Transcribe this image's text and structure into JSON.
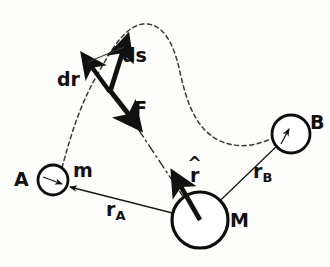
{
  "figure": {
    "type": "physics-vector-diagram",
    "width": 330,
    "height": 267,
    "background_color": "#fdfdfc",
    "ink_color": "#111111"
  },
  "bodies": [
    {
      "id": "A",
      "label": "A",
      "secondary_label": "m",
      "role": "start-point-mass",
      "cx": 53,
      "cy": 180,
      "r": 15,
      "stroke_width": 2.6
    },
    {
      "id": "M",
      "label": "M",
      "role": "central-mass",
      "cx": 200,
      "cy": 220,
      "r": 28,
      "stroke_width": 3.0
    },
    {
      "id": "B",
      "label": "B",
      "role": "end-point",
      "cx": 291,
      "cy": 134,
      "r": 19,
      "stroke_width": 2.6
    }
  ],
  "vectors": [
    {
      "id": "ds",
      "label": "ds",
      "style": "bold-solid",
      "from": [
        110,
        92
      ],
      "to": [
        125,
        45
      ],
      "description": "displacement element along the path, tangent to trajectory"
    },
    {
      "id": "dr",
      "label": "dr",
      "style": "bold-solid",
      "from": [
        110,
        92
      ],
      "to": [
        88,
        63
      ],
      "description": "radial displacement component"
    },
    {
      "id": "F",
      "label": "F",
      "style": "bold-solid",
      "from": [
        110,
        92
      ],
      "to": [
        133,
        120
      ],
      "description": "gravitational force on m directed toward M"
    },
    {
      "id": "r-hat",
      "label": "r",
      "accent": "^",
      "style": "bold-solid",
      "from": [
        200,
        220
      ],
      "to": [
        176,
        178
      ],
      "description": "radial unit vector from M outward"
    }
  ],
  "radii": [
    {
      "id": "rA",
      "label": "r",
      "subscript": "A",
      "from": [
        200,
        220
      ],
      "to": [
        67,
        187
      ],
      "style": "thin-solid-arrow",
      "description": "distance from M to starting position A"
    },
    {
      "id": "rB",
      "label": "r",
      "subscript": "B",
      "from": [
        200,
        220
      ],
      "to": [
        278,
        142
      ],
      "style": "thin-solid-arrow",
      "description": "distance from M to end position B"
    }
  ],
  "path": {
    "id": "trajectory",
    "style": "dashed",
    "description": "dashed S-shaped trajectory of mass m from A over a peak down to B",
    "points": "M 62,168 C 72,130 82,100 100,70 C 112,48 126,26 143,24 C 163,22 174,44 180,72 C 187,104 196,128 218,140 C 238,150 258,145 273,138"
  },
  "force_line": {
    "id": "force-action-line",
    "style": "dash-dot",
    "description": "dash-dot line of action of F extending from the force vector tip to the centre of M",
    "from": [
      133,
      120
    ],
    "to": [
      200,
      220
    ]
  },
  "labels": {
    "A": {
      "text": "A",
      "x": 14,
      "y": 171,
      "weight": "plain"
    },
    "m": {
      "text": "m",
      "x": 73,
      "y": 163,
      "weight": "plain"
    },
    "M": {
      "text": "M",
      "x": 230,
      "y": 212,
      "weight": "plain"
    },
    "B": {
      "text": "B",
      "x": 311,
      "y": 114,
      "weight": "plain"
    },
    "ds": {
      "text": "ds",
      "x": 122,
      "y": 46,
      "weight": "bold"
    },
    "dr": {
      "text": "dr",
      "x": 58,
      "y": 70,
      "weight": "bold"
    },
    "F": {
      "text": "F",
      "x": 133,
      "y": 99,
      "weight": "bold"
    },
    "r_hat": {
      "text": "r",
      "accent": "^",
      "x": 190,
      "y": 164
    },
    "r_A": {
      "text": "r",
      "subscript": "A",
      "x": 106,
      "y": 201
    },
    "r_B": {
      "text": "r",
      "subscript": "B",
      "x": 253,
      "y": 163
    }
  }
}
